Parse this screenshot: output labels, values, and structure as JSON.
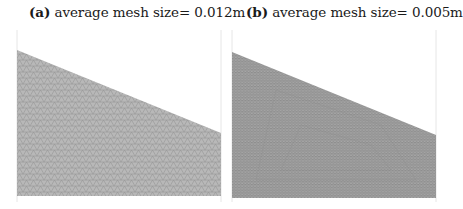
{
  "figure": {
    "panels": [
      {
        "label": "(a)",
        "caption": "average mesh size= 0.012m",
        "mesh_size_m": 0.012,
        "fill_color": "#b3b3b3",
        "edge_color": "#8a8a8a"
      },
      {
        "label": "(b)",
        "caption": "average mesh size= 0.005m",
        "mesh_size_m": 0.005,
        "fill_color": "#a0a0a0",
        "edge_color": "#7a7a7a"
      }
    ],
    "frame_color": "#e6e6e6"
  }
}
